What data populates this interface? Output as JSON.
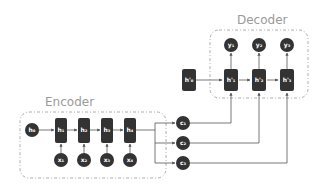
{
  "encoder": {
    "title": "Encoder",
    "initial_state": "h₀",
    "hidden_states": [
      "h₁",
      "h₂",
      "h₃",
      "h₄"
    ],
    "inputs": [
      "x₁",
      "x₂",
      "x₃",
      "x₄"
    ]
  },
  "context": {
    "vectors": [
      "c₁",
      "c₂",
      "c₃"
    ]
  },
  "decoder": {
    "title": "Decoder",
    "initial_state": "h'₀",
    "hidden_states": [
      "h'₁",
      "h'₂",
      "h'₃"
    ],
    "outputs": [
      "y₁",
      "y₂",
      "y₃"
    ]
  },
  "colors": {
    "node": "#333333",
    "edge": "#555555",
    "box": "#999999",
    "title": "#9a9a9a"
  }
}
